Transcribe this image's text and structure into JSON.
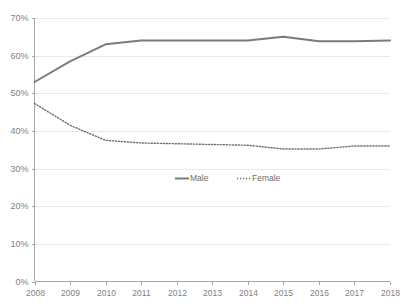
{
  "chart_data": {
    "type": "line",
    "title": "",
    "xlabel": "",
    "ylabel": "",
    "x": [
      2008,
      2009,
      2010,
      2011,
      2012,
      2013,
      2014,
      2015,
      2016,
      2017,
      2018
    ],
    "categories": [
      "2008",
      "2009",
      "2010",
      "2011",
      "2012",
      "2013",
      "2014",
      "2015",
      "2016",
      "2017",
      "2018"
    ],
    "series": [
      {
        "name": "Male",
        "style": "solid",
        "color": "#7b7b7b",
        "values": [
          53.0,
          58.5,
          63.0,
          64.0,
          64.0,
          64.0,
          64.0,
          65.0,
          63.8,
          63.8,
          64.0
        ]
      },
      {
        "name": "Female",
        "style": "dotted",
        "color": "#6e6e6e",
        "values": [
          47.3,
          41.5,
          37.5,
          36.8,
          36.6,
          36.4,
          36.2,
          35.2,
          35.2,
          36.0,
          36.0
        ]
      }
    ],
    "ylim": [
      0,
      70
    ],
    "ytick_values": [
      0,
      10,
      20,
      30,
      40,
      50,
      60,
      70
    ],
    "ytick_labels": [
      "0%",
      "10%",
      "20%",
      "30%",
      "40%",
      "50%",
      "60%",
      "70%"
    ],
    "grid": true,
    "legend_position": "center",
    "legend": [
      "Male",
      "Female"
    ]
  },
  "legend": {
    "male_label": "Male",
    "female_label": "Female"
  },
  "axes": {
    "y_labels": [
      "70%",
      "60%",
      "50%",
      "40%",
      "30%",
      "20%",
      "10%",
      "0%"
    ],
    "x_labels": [
      "2008",
      "2009",
      "2010",
      "2011",
      "2012",
      "2013",
      "2014",
      "2015",
      "2016",
      "2017",
      "2018"
    ]
  },
  "title": {
    "clipped_text": ""
  }
}
